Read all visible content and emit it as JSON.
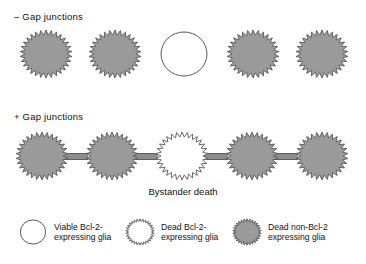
{
  "figure": {
    "caption": "Bystander death",
    "colors": {
      "cell_fill_dead_non_bcl2": "#9a9a9a",
      "cell_fill_viable": "#ffffff",
      "cell_fill_dead_bcl2": "#ffffff",
      "cell_stroke": "#595959",
      "connector_fill": "#8c8c8c",
      "text": "#111111",
      "background": "#ffffff"
    },
    "shape_params": {
      "spike_points": 30,
      "spike_outer_rx": 26,
      "spike_outer_ry": 24,
      "spike_inner_rx": 21,
      "spike_inner_ry": 19,
      "smooth_rx": 23,
      "smooth_ry": 22
    }
  },
  "rows": [
    {
      "id": "no-gap",
      "label": "– Gap junctions",
      "connected": false,
      "cells": [
        {
          "type": "dead-non-bcl2",
          "shape": "spiky",
          "fill": "#9a9a9a",
          "x": 18
        },
        {
          "type": "dead-non-bcl2",
          "shape": "spiky",
          "fill": "#9a9a9a",
          "x": 87
        },
        {
          "type": "viable-bcl2",
          "shape": "smooth",
          "fill": "#ffffff",
          "x": 156
        },
        {
          "type": "dead-non-bcl2",
          "shape": "spiky",
          "fill": "#9a9a9a",
          "x": 225
        },
        {
          "type": "dead-non-bcl2",
          "shape": "spiky",
          "fill": "#9a9a9a",
          "x": 294
        }
      ]
    },
    {
      "id": "with-gap",
      "label": "+ Gap junctions",
      "connected": true,
      "cells": [
        {
          "type": "dead-non-bcl2",
          "shape": "spiky",
          "fill": "#9a9a9a",
          "x": 14
        },
        {
          "type": "dead-non-bcl2",
          "shape": "spiky",
          "fill": "#9a9a9a",
          "x": 84
        },
        {
          "type": "dead-bcl2",
          "shape": "spiky",
          "fill": "#ffffff",
          "x": 154
        },
        {
          "type": "dead-non-bcl2",
          "shape": "spiky",
          "fill": "#9a9a9a",
          "x": 224
        },
        {
          "type": "dead-non-bcl2",
          "shape": "spiky",
          "fill": "#9a9a9a",
          "x": 294
        }
      ],
      "connectors": [
        {
          "x": 64,
          "width": 24
        },
        {
          "x": 134,
          "width": 24
        },
        {
          "x": 204,
          "width": 24
        },
        {
          "x": 274,
          "width": 24
        }
      ]
    }
  ],
  "legend": {
    "entries": [
      {
        "marker": "smooth-white-circle",
        "shape": "smooth",
        "fill": "#ffffff",
        "line1": "Viable Bcl-2-",
        "line2": "expressing glia"
      },
      {
        "marker": "spiky-white-circle",
        "shape": "spiky",
        "fill": "#ffffff",
        "line1": "Dead Bcl-2-",
        "line2": "expressing glia"
      },
      {
        "marker": "spiky-gray-circle",
        "shape": "spiky",
        "fill": "#9a9a9a",
        "line1": "Dead non-Bcl-2",
        "line2": "expressing glia"
      }
    ]
  }
}
